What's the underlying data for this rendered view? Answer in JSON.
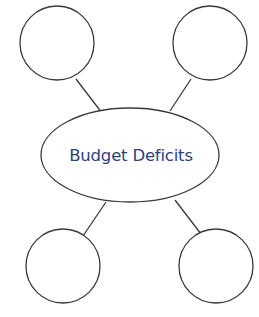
{
  "diagram": {
    "type": "concept-web",
    "center": {
      "label": "Budget Deficits"
    },
    "satellites": [
      {
        "position": "top-left",
        "label": ""
      },
      {
        "position": "top-right",
        "label": ""
      },
      {
        "position": "bottom-left",
        "label": ""
      },
      {
        "position": "bottom-right",
        "label": ""
      }
    ],
    "colors": {
      "text": "#2e3f7c",
      "stroke": "#3a3a3a",
      "background": "#ffffff"
    }
  }
}
